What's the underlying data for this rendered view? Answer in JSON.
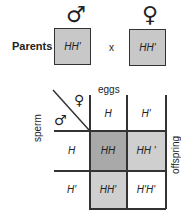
{
  "parents": {
    "label": "Parents",
    "male_symbol": "♂",
    "female_symbol": "♀",
    "male_genotype": "HH'",
    "female_genotype": "HH'",
    "cross_sign": "x"
  },
  "punnett": {
    "corner_male_symbol": "♂",
    "corner_female_symbol": "♀",
    "column_header_label": "eggs",
    "row_header_label": "sperm",
    "side_label": "offspring",
    "egg_alleles": [
      "H",
      "H'"
    ],
    "sperm_alleles": [
      "H",
      "H'"
    ],
    "offspring": [
      [
        "HH",
        "HH '"
      ],
      [
        "HH'",
        "H'H'"
      ]
    ]
  },
  "colors": {
    "parent_box": "#c8c8c8",
    "homozygous_dominant": "#a9a9a9",
    "heterozygous": "#cfcfcf",
    "homozygous_recessive": "#ffffff"
  }
}
